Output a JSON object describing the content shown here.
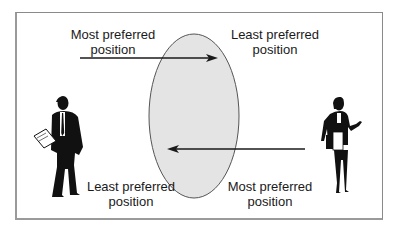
{
  "diagram": {
    "labels": {
      "top_left": {
        "line1": "Most preferred",
        "line2": "position"
      },
      "top_right": {
        "line1": "Least preferred",
        "line2": "position"
      },
      "bottom_left": {
        "line1": "Least preferred",
        "line2": "position"
      },
      "bottom_right": {
        "line1": "Most preferred",
        "line2": "position"
      }
    },
    "figures": {
      "left": "businessman-silhouette",
      "right": "businesswoman-silhouette"
    },
    "center_shape": "bargaining-zone-ellipse",
    "colors": {
      "ellipse_fill": "#e4e4e4",
      "ellipse_stroke": "#555555",
      "arrow": "#1a1a1a",
      "frame": "#8a8a8a"
    }
  }
}
